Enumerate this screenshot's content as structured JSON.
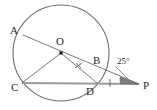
{
  "figure": {
    "kind": "circle-geometry-diagram",
    "background_color": "#ffffff",
    "ink_color": "#6a6a6a",
    "chord_color": "#9a9a9a",
    "label_color": "#2b2b2b"
  },
  "circle": {
    "name": "main-circle",
    "center_label": "O",
    "center_x": 61,
    "center_y": 53,
    "radius": 48
  },
  "points": [
    {
      "id": "A",
      "label": "A",
      "x": 23,
      "y": 35,
      "label_x": 10,
      "label_y": 34,
      "on_circle": true
    },
    {
      "id": "O",
      "label": "O",
      "x": 61,
      "y": 53,
      "label_x": 56,
      "label_y": 45,
      "on_circle": false
    },
    {
      "id": "B",
      "label": "B",
      "x": 103,
      "y": 66,
      "label_x": 93,
      "label_y": 64,
      "on_circle": true
    },
    {
      "id": "C",
      "label": "C",
      "x": 22,
      "y": 83,
      "label_x": 11,
      "label_y": 91,
      "on_circle": true
    },
    {
      "id": "D",
      "label": "D",
      "x": 97,
      "y": 83,
      "label_x": 86,
      "label_y": 95,
      "on_circle": true
    },
    {
      "id": "P",
      "label": "P",
      "x": 139,
      "y": 84,
      "label_x": 143,
      "label_y": 89,
      "on_circle": false
    }
  ],
  "segments": [
    {
      "name": "secant-a-to-p",
      "from": "A",
      "to": "P",
      "style": "thin"
    },
    {
      "name": "radius-o-to-c",
      "from": "O",
      "to": "C",
      "style": "thin"
    },
    {
      "name": "radius-o-to-d",
      "from": "O",
      "to": "D",
      "style": "thin"
    },
    {
      "name": "chord-c-to-d-extended-to-p",
      "from": "C",
      "to": "P",
      "style": "chord"
    }
  ],
  "tick_marks": [
    {
      "name": "tick-on-segment-od",
      "x": 79,
      "y": 68
    },
    {
      "name": "tick-on-segment-dp",
      "x": 110,
      "y": 83
    }
  ],
  "angles": [
    {
      "name": "angle-at-p",
      "vertex": "P",
      "value": "25",
      "unit": "°",
      "label": "25°",
      "label_x": 117,
      "label_y": 64,
      "leader_from_x": 115,
      "leader_from_y": 67,
      "leader_to_x": 128,
      "leader_to_y": 80
    }
  ]
}
